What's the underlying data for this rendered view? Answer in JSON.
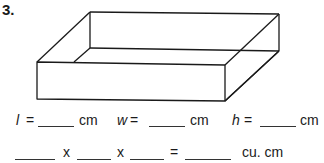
{
  "problem": {
    "number": "3."
  },
  "figure": {
    "type": "rectangular-prism-open-box",
    "stroke_color": "#1a1a1a"
  },
  "dimensions_row": {
    "length": {
      "variable": "l",
      "equals": "=",
      "value": "",
      "unit": "cm"
    },
    "width": {
      "variable": "w",
      "equals": "=",
      "value": "",
      "unit": "cm"
    },
    "height": {
      "variable": "h",
      "equals": "=",
      "value": "",
      "unit": "cm"
    }
  },
  "volume_row": {
    "factor1": "",
    "times1": "x",
    "factor2": "",
    "times2": "x",
    "factor3": "",
    "equals": "=",
    "result": "",
    "unit": "cu. cm"
  }
}
